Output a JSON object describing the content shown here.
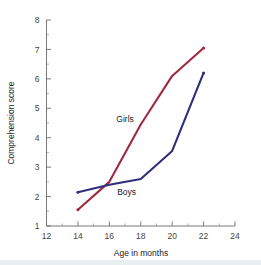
{
  "chart_data": {
    "type": "line",
    "title": "",
    "xlabel": "Age in months",
    "ylabel": "Comprehension score",
    "xlim": [
      12,
      24
    ],
    "ylim": [
      1,
      8
    ],
    "x_ticks": [
      12,
      14,
      16,
      18,
      20,
      22,
      24
    ],
    "x_tick_labels": [
      "12",
      "14",
      "16",
      "18",
      "20",
      "22",
      "24"
    ],
    "x_minor_ticks": [
      13,
      15,
      17,
      19,
      21,
      23
    ],
    "y_ticks": [
      1,
      2,
      3,
      4,
      5,
      6,
      7,
      8
    ],
    "y_tick_labels": [
      "1",
      "2",
      "3",
      "4",
      "5",
      "6",
      "7",
      "8"
    ],
    "y_minor_ticks": [
      1.5,
      2.5,
      3.5,
      4.5,
      5.5,
      6.5,
      7.5
    ],
    "grid": false,
    "legend": "inline-labels",
    "x": [
      14,
      16,
      18,
      20,
      22
    ],
    "series": [
      {
        "name": "Girls",
        "color": "#9e2a42",
        "values": [
          1.55,
          2.5,
          4.45,
          6.1,
          7.05
        ],
        "label_x": 17.0,
        "label_y": 4.55
      },
      {
        "name": "Boys",
        "color": "#2e2f7a",
        "values": [
          2.15,
          2.4,
          2.6,
          3.55,
          6.2
        ],
        "label_x": 17.1,
        "label_y": 2.05
      }
    ]
  },
  "axes": {
    "x_title": "Age in months",
    "y_title": "Comprehension score"
  },
  "ticks": {
    "x": [
      "12",
      "14",
      "16",
      "18",
      "20",
      "22",
      "24"
    ],
    "y": [
      "1",
      "2",
      "3",
      "4",
      "5",
      "6",
      "7",
      "8"
    ]
  },
  "series_labels": {
    "girls": "Girls",
    "boys": "Boys"
  },
  "colors": {
    "girls": "#9e2a42",
    "boys": "#2e2f7a",
    "axis": "#6b6b6b",
    "background": "#ffffff"
  }
}
